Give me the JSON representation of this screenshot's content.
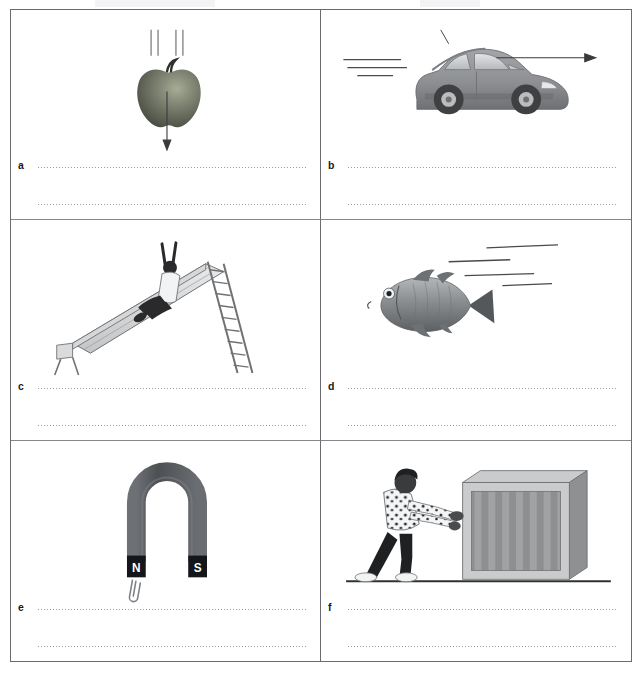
{
  "worksheet": {
    "title": "Forces worksheet",
    "cells": [
      {
        "id": "a",
        "label": "a",
        "illustration": "falling-apple",
        "description": "An apple falling downwards with motion lines above it and a downward arrow showing the force of gravity",
        "answer_line_1": "",
        "answer_line_2": ""
      },
      {
        "id": "b",
        "label": "b",
        "illustration": "moving-car",
        "description": "A car driving to the right with speed lines behind it and an arrow pointing right",
        "answer_line_1": "",
        "answer_line_2": ""
      },
      {
        "id": "c",
        "label": "c",
        "illustration": "child-on-slide",
        "description": "A child sliding down a playground slide with arms raised, ladder at the right",
        "answer_line_1": "",
        "answer_line_2": ""
      },
      {
        "id": "d",
        "label": "d",
        "illustration": "swimming-fish",
        "description": "A fish swimming to the left with motion lines trailing behind it",
        "answer_line_1": "",
        "answer_line_2": ""
      },
      {
        "id": "e",
        "label": "e",
        "illustration": "horseshoe-magnet",
        "description": "A horseshoe magnet attracting a paper clip",
        "pole_north": "N",
        "pole_south": "S",
        "answer_line_1": "",
        "answer_line_2": ""
      },
      {
        "id": "f",
        "label": "f",
        "illustration": "person-pushing-box",
        "description": "A person pushing a large striped box along the ground",
        "answer_line_1": "",
        "answer_line_2": ""
      }
    ]
  },
  "colors": {
    "border": "#6b6b6f",
    "dotted_line": "#9a9a9e",
    "apple": "#5f6355",
    "car_body": "#8d8f92",
    "fish": "#8a8d8f",
    "magnet": "#555559",
    "box": "#9a9a9a",
    "ink": "#1b1b1b"
  }
}
